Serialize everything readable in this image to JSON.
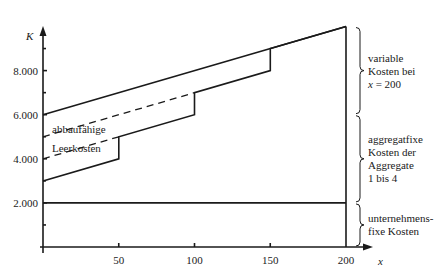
{
  "chart_data": {
    "type": "line",
    "title": "",
    "xlabel": "x",
    "ylabel": "K",
    "xlim": [
      0,
      200
    ],
    "ylim": [
      0,
      10000
    ],
    "x_ticks": [
      50,
      100,
      150,
      200
    ],
    "x_tick_labels": [
      "50",
      "100",
      "150",
      "200"
    ],
    "y_ticks": [
      2000,
      4000,
      6000,
      8000
    ],
    "y_tick_labels": [
      "2.000",
      "4.000",
      "6.000",
      "8.000"
    ],
    "y_minor_ticks": [
      1000,
      3000,
      5000,
      7000,
      9000
    ],
    "grid": false,
    "series": [
      {
        "name": "Gesamtkosten",
        "style": "solid",
        "points": [
          [
            0,
            6000
          ],
          [
            200,
            10000
          ]
        ]
      },
      {
        "name": "unternehmensfixe Kosten",
        "style": "solid",
        "points": [
          [
            0,
            2000
          ],
          [
            200,
            2000
          ]
        ]
      },
      {
        "name": "Aggregat-Treppe",
        "style": "solid",
        "points": [
          [
            0,
            3000
          ],
          [
            50,
            4000
          ],
          [
            50,
            5000
          ],
          [
            100,
            6000
          ],
          [
            100,
            7000
          ],
          [
            150,
            8000
          ],
          [
            150,
            9000
          ],
          [
            200,
            10000
          ]
        ]
      },
      {
        "name": "abbaufaehige Leerkosten 1",
        "style": "dashed",
        "points": [
          [
            0,
            4000
          ],
          [
            50,
            5000
          ]
        ]
      },
      {
        "name": "abbaufaehige Leerkosten 2",
        "style": "dashed",
        "points": [
          [
            0,
            5000
          ],
          [
            100,
            7000
          ]
        ]
      },
      {
        "name": "Kapazitaetsgrenze",
        "style": "solid",
        "points": [
          [
            200,
            0
          ],
          [
            200,
            10000
          ]
        ]
      }
    ],
    "annotations": {
      "leerkosten_line1": "abbaufähige",
      "leerkosten_line2": "Leerkosten",
      "brace_top": [
        "variable",
        "Kosten bei",
        "x = 200"
      ],
      "brace_mid": [
        "aggregatfixe",
        "Kosten der",
        "Aggregate",
        "1 bis 4"
      ],
      "brace_bottom": [
        "unternehmens-",
        "fixe Kosten"
      ]
    },
    "brace_ranges": {
      "top": [
        6000,
        10000
      ],
      "mid": [
        2000,
        6000
      ],
      "bottom": [
        0,
        2000
      ]
    }
  }
}
